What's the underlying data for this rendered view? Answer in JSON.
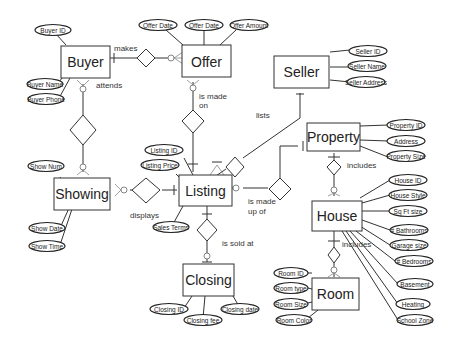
{
  "entities": {
    "buyer": {
      "label": "Buyer",
      "attributes": [
        "Buyer ID",
        "Buyer Name",
        "Buyer Phone"
      ]
    },
    "offer": {
      "label": "Offer",
      "attributes": [
        "Offer Date",
        "Offer Date",
        "Offer Amount"
      ]
    },
    "seller": {
      "label": "Seller",
      "attributes": [
        "Seller ID",
        "Seller Name",
        "Seller Address"
      ]
    },
    "property": {
      "label": "Property",
      "attributes": [
        "Property ID",
        "Address",
        "Property Size"
      ]
    },
    "showing": {
      "label": "Showing",
      "attributes": [
        "Show Num",
        "Show Date",
        "Show Time"
      ]
    },
    "listing": {
      "label": "Listing",
      "attributes": [
        "Listing ID",
        "Listing Price",
        "Sales Terms"
      ]
    },
    "house": {
      "label": "House",
      "attributes": [
        "House ID",
        "House Style",
        "Sq Ft size",
        "# Bathrooms",
        "Garage size",
        "# Bedrooms",
        "Basement",
        "Heating",
        "School Zone"
      ]
    },
    "closing": {
      "label": "Closing",
      "attributes": [
        "Closing ID",
        "Closing fee",
        "Closing date"
      ]
    },
    "room": {
      "label": "Room",
      "attributes": [
        "Room ID",
        "Room type",
        "Room Size",
        "Room Color"
      ]
    }
  },
  "relationships": {
    "makes": "makes",
    "attends": "attends",
    "is_made_on_1": "is made",
    "is_made_on_2": "on",
    "lists": "lists",
    "includes_property": "includes",
    "displays": "displays",
    "is_made_up_of_1": "is made",
    "is_made_up_of_2": "up of",
    "is_sold_at": "is sold at",
    "includes_house": "includes"
  }
}
